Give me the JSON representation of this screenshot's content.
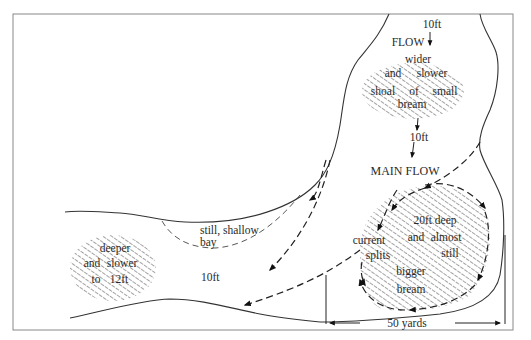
{
  "diagram": {
    "labels": {
      "depth_top": "10ft",
      "flow_top": "FLOW",
      "top_shoal": [
        "wider",
        "and",
        "slower",
        "shoal",
        "of",
        "small",
        "bream"
      ],
      "depth_mid": "10ft",
      "main_flow": "MAIN FLOW",
      "deep_hole": [
        "20ft deep",
        "and",
        "almost",
        "still",
        "bigger",
        "bream"
      ],
      "current_splits": [
        "current",
        "splits"
      ],
      "bay": [
        "still, shallow",
        "bay"
      ],
      "depth_left": "10ft",
      "left_hole": [
        "deeper",
        "and",
        "slower",
        "to",
        "12ft"
      ],
      "scale": "50 yards"
    },
    "colors": {
      "ink": "#222222",
      "frame": "#888888",
      "background": "#ffffff"
    }
  }
}
